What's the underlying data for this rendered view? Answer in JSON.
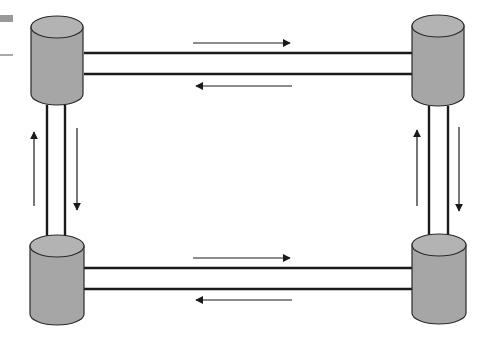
{
  "diagram": {
    "title": "",
    "colors": {
      "node_fill": "#a6a6a6",
      "node_top_fill": "#b3b3b3",
      "outline": "#2a2a2a",
      "link": "#1a1a1a",
      "background": "#ffffff"
    },
    "nodes": [
      {
        "id": "top-left",
        "shape": "database-cylinder"
      },
      {
        "id": "top-right",
        "shape": "database-cylinder"
      },
      {
        "id": "bottom-left",
        "shape": "database-cylinder"
      },
      {
        "id": "bottom-right",
        "shape": "database-cylinder"
      }
    ],
    "links": [
      {
        "from": "top-left",
        "to": "top-right",
        "style": "double-line",
        "arrows": [
          "right",
          "left"
        ]
      },
      {
        "from": "bottom-left",
        "to": "bottom-right",
        "style": "double-line",
        "arrows": [
          "right",
          "left"
        ]
      },
      {
        "from": "top-left",
        "to": "bottom-left",
        "style": "double-line",
        "arrows": [
          "up",
          "down"
        ]
      },
      {
        "from": "top-right",
        "to": "bottom-right",
        "style": "double-line",
        "arrows": [
          "up",
          "down"
        ]
      }
    ]
  }
}
